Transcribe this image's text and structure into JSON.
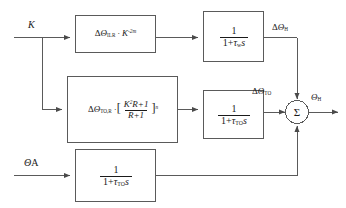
{
  "diagram": {
    "line_color": "#5a5a5a",
    "text_color": "#1a1a1a",
    "background": "#ffffff"
  },
  "inputs": [
    {
      "name": "input-k",
      "label": "K",
      "symbol": "K"
    },
    {
      "name": "input-theta-a",
      "label": "ΘA",
      "symbol_greek": "Θ",
      "symbol_suffix": "A"
    }
  ],
  "blocks": [
    {
      "id": "block-ilr-gain",
      "name": "block-delta-theta-ilr-gain",
      "expression": "ΔΘ_ILR · K^(-2m)",
      "delta": "Δ",
      "theta": "Θ",
      "subscript": "ILR",
      "operator": "·",
      "variable": "K",
      "exponent": "-2m"
    },
    {
      "id": "block-to-r-gain",
      "name": "block-delta-theta-to-r-gain",
      "expression": "ΔΘ_TO,R · [ (K²R+1) / (R+1) ]^n",
      "delta": "Δ",
      "theta": "Θ",
      "subscript": "TO,R",
      "operator": "·",
      "bracket_open": "[",
      "bracket_close": "]",
      "numerator_var": "K",
      "numerator_pow": "2",
      "numerator_rest": "R+1",
      "denominator": "R+1",
      "exponent": "n"
    },
    {
      "id": "block-tau-w",
      "name": "block-transfer-tau-w",
      "expression": "1 / (1 + τ_w s)",
      "numerator": "1",
      "den_one": "1+",
      "den_tau": "τ",
      "den_sub": "w",
      "den_s": "s"
    },
    {
      "id": "block-tau-to-mid",
      "name": "block-transfer-tau-to-middle",
      "expression": "1 / (1 + τ_TO s)",
      "numerator": "1",
      "den_one": "1+",
      "den_tau": "τ",
      "den_sub": "TO",
      "den_s": "s"
    },
    {
      "id": "block-tau-to-bottom",
      "name": "block-transfer-tau-to-bottom",
      "expression": "1 / (1 + τ_TO s)",
      "numerator": "1",
      "den_one": "1+",
      "den_tau": "τ",
      "den_sub": "TO",
      "den_s": "s"
    }
  ],
  "signals": [
    {
      "name": "signal-delta-theta-h",
      "label": "ΔΘ_H",
      "delta": "Δ",
      "theta": "Θ",
      "subscript": "H"
    },
    {
      "name": "signal-delta-theta-to",
      "label": "ΔΘ_TO",
      "delta": "Δ",
      "theta": "Θ",
      "subscript": "TO"
    }
  ],
  "summing_junction": {
    "name": "summing-junction",
    "glyph": "Σ",
    "label": "Sigma"
  },
  "output": {
    "name": "output-theta-h",
    "label": "Θ_H",
    "theta": "Θ",
    "subscript": "H"
  }
}
